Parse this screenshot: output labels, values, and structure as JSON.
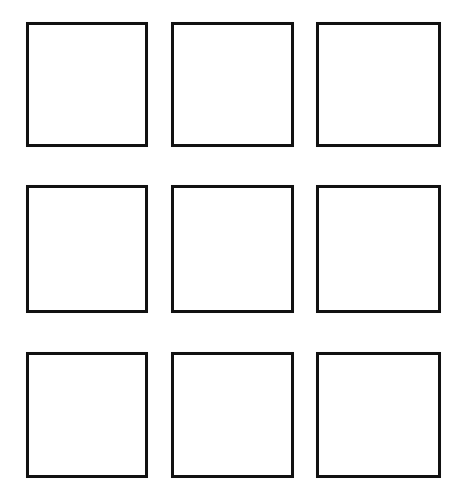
{
  "page": {
    "width": 468,
    "height": 504,
    "background_color": "#ffffff",
    "stroke_color": "#111111",
    "stroke_width_px": 3
  },
  "grid": {
    "rows": 3,
    "columns": 3,
    "cell_count": 9,
    "cells_are_empty": true,
    "cells": [
      {
        "id": "cell-r1c1",
        "row": 1,
        "column": 1,
        "x": 26,
        "y": 22,
        "width": 122,
        "height": 125,
        "text": ""
      },
      {
        "id": "cell-r1c2",
        "row": 1,
        "column": 2,
        "x": 171,
        "y": 22,
        "width": 123,
        "height": 125,
        "text": ""
      },
      {
        "id": "cell-r1c3",
        "row": 1,
        "column": 3,
        "x": 316,
        "y": 22,
        "width": 125,
        "height": 125,
        "text": ""
      },
      {
        "id": "cell-r2c1",
        "row": 2,
        "column": 1,
        "x": 26,
        "y": 185,
        "width": 122,
        "height": 128,
        "text": ""
      },
      {
        "id": "cell-r2c2",
        "row": 2,
        "column": 2,
        "x": 171,
        "y": 185,
        "width": 123,
        "height": 128,
        "text": ""
      },
      {
        "id": "cell-r2c3",
        "row": 2,
        "column": 3,
        "x": 316,
        "y": 185,
        "width": 125,
        "height": 128,
        "text": ""
      },
      {
        "id": "cell-r3c1",
        "row": 3,
        "column": 1,
        "x": 26,
        "y": 352,
        "width": 122,
        "height": 126,
        "text": ""
      },
      {
        "id": "cell-r3c2",
        "row": 3,
        "column": 2,
        "x": 171,
        "y": 352,
        "width": 123,
        "height": 126,
        "text": ""
      },
      {
        "id": "cell-r3c3",
        "row": 3,
        "column": 3,
        "x": 316,
        "y": 352,
        "width": 125,
        "height": 126,
        "text": ""
      }
    ]
  }
}
